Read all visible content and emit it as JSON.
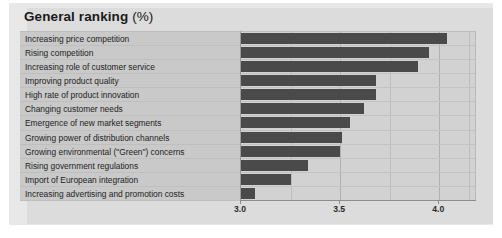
{
  "figure": {
    "title_main": "General ranking",
    "title_unit": "(%)",
    "bar_color": "#4a4a4a",
    "panel_color": "#dcdcdc",
    "label_panel_color": "#c9c9c9",
    "plot_bg_color": "#d2d2d2"
  },
  "chart_data": {
    "type": "bar",
    "orientation": "horizontal",
    "xlabel": "",
    "ylabel": "",
    "xlim": [
      3.0,
      4.19
    ],
    "xticks": [
      3.0,
      3.5,
      4.0
    ],
    "xticklabels": [
      "3.0",
      "3.5",
      "4.0"
    ],
    "minor_gridlines": [
      3.25,
      3.75,
      4.15
    ],
    "grid": true,
    "legend": null,
    "categories": [
      "Increasing price competition",
      "Rising competition",
      "Increasing role of customer service",
      "Improving product quality",
      "High rate of product innovation",
      "Changing customer needs",
      "Emergence of new market segments",
      "Growing power of distribution channels",
      "Growing environmental (\"Green\") concerns",
      "Rising government regulations",
      "Import of European integration",
      "Increasing advertising and promotion costs"
    ],
    "values": [
      4.04,
      3.95,
      3.89,
      3.68,
      3.68,
      3.62,
      3.55,
      3.51,
      3.5,
      3.34,
      3.25,
      3.07
    ]
  }
}
